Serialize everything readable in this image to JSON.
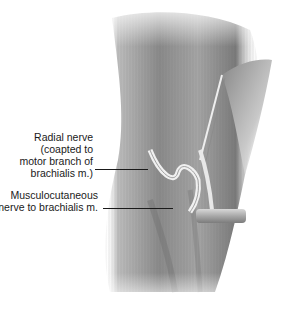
{
  "figure": {
    "labels": [
      {
        "lines": [
          "Radial nerve",
          "(coapted to",
          "motor branch of",
          "brachialis m.)"
        ]
      },
      {
        "lines": [
          "Musculocutaneous",
          "nerve to brachialis m."
        ]
      }
    ],
    "colors": {
      "muscle_dark": "#6e6e6e",
      "muscle_mid": "#9a9a9a",
      "muscle_light": "#cfcfcf",
      "nerve": "#e6e6e6",
      "retractor": "#b8b8b8",
      "text": "#1a1a1a"
    }
  }
}
